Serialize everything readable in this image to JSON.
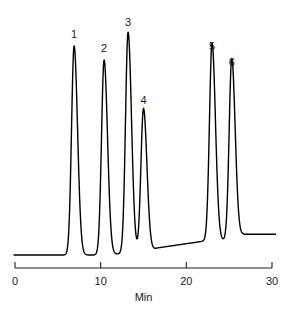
{
  "chart_data": {
    "type": "line",
    "title": "",
    "subtitle": "",
    "xlabel": "Min",
    "ylabel": "",
    "xlim": [
      0,
      30
    ],
    "ylim": [
      0,
      100
    ],
    "grid": false,
    "legend": "none",
    "x_ticks": [
      0,
      10,
      20,
      30
    ],
    "x_tick_labels": [
      "0",
      "10",
      "20",
      "30"
    ],
    "y_ticks": [],
    "y_tick_labels": [],
    "series": [
      {
        "name": "detector-signal",
        "peaks": [
          {
            "label": "1",
            "retention_time": 6.9,
            "height": 89
          },
          {
            "label": "2",
            "retention_time": 10.4,
            "height": 83
          },
          {
            "label": "3",
            "retention_time": 13.2,
            "height": 94
          },
          {
            "label": "4",
            "retention_time": 15.0,
            "height": 61
          },
          {
            "label": "5",
            "retention_time": 23.0,
            "height": 84
          },
          {
            "label": "6",
            "retention_time": 25.3,
            "height": 77
          }
        ]
      }
    ],
    "annotations": [
      {
        "text": "1",
        "x": 6.9,
        "y": 92
      },
      {
        "text": "2",
        "x": 10.4,
        "y": 86
      },
      {
        "text": "3",
        "x": 13.2,
        "y": 97
      },
      {
        "text": "4",
        "x": 15.0,
        "y": 64
      },
      {
        "text": "5",
        "x": 23.0,
        "y": 87
      },
      {
        "text": "6",
        "x": 25.3,
        "y": 80
      }
    ]
  },
  "axis": {
    "x_title": "Min",
    "ticks": [
      {
        "value": "0"
      },
      {
        "value": "10"
      },
      {
        "value": "20"
      },
      {
        "value": "30"
      }
    ]
  },
  "peak_labels": [
    {
      "text": "1"
    },
    {
      "text": "2"
    },
    {
      "text": "3"
    },
    {
      "text": "4"
    },
    {
      "text": "5"
    },
    {
      "text": "6"
    }
  ],
  "colors": {
    "trace": "#000000",
    "axis": "#1a1a1a",
    "background": "#ffffff",
    "text": "#1a1a1a"
  }
}
